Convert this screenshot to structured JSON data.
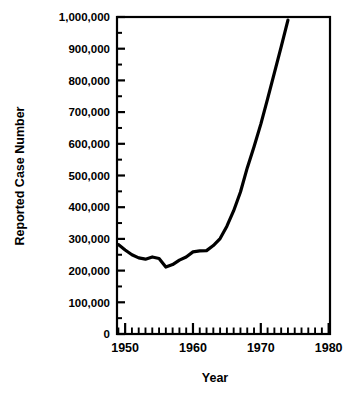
{
  "chart_data": {
    "type": "line",
    "title": "",
    "xlabel": "Year",
    "ylabel": "Reported Case Number",
    "xlim": [
      1948.8,
      1980.2
    ],
    "ylim": [
      0,
      1000000
    ],
    "grid": false,
    "legend": "none",
    "line_color": "#000000",
    "x_major_ticks": [
      1950,
      1960,
      1970,
      1980
    ],
    "x_major_tick_labels": [
      "1950",
      "1960",
      "1970",
      "1980"
    ],
    "x_minor_tick_step": 1,
    "y_major_ticks": [
      0,
      100000,
      200000,
      300000,
      400000,
      500000,
      600000,
      700000,
      800000,
      900000,
      1000000
    ],
    "y_major_tick_labels": [
      "0",
      "100,000",
      "200,000",
      "300,000",
      "400,000",
      "500,000",
      "600,000",
      "700,000",
      "800,000",
      "900,000",
      "1,000,000"
    ],
    "y_minor_tick_step": 50000,
    "series": [
      {
        "name": "Reported Case Number",
        "x": [
          1949,
          1950,
          1951,
          1952,
          1953,
          1954,
          1955,
          1956,
          1957,
          1958,
          1959,
          1960,
          1961,
          1962,
          1963,
          1964,
          1965,
          1966,
          1967,
          1968,
          1969,
          1970,
          1971,
          1972,
          1973,
          1974
        ],
        "values": [
          282000,
          265000,
          250000,
          240000,
          236000,
          243000,
          238000,
          211000,
          219000,
          233000,
          243000,
          259000,
          262000,
          263000,
          279000,
          301000,
          340000,
          389000,
          448000,
          524000,
          591000,
          662000,
          742000,
          824000,
          906000,
          990000
        ]
      }
    ]
  }
}
